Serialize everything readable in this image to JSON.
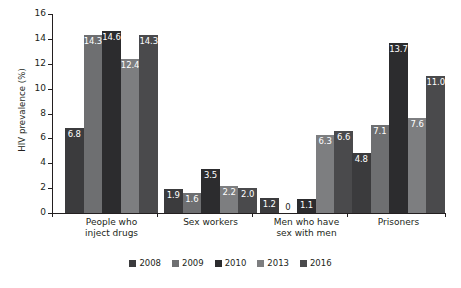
{
  "chart_data": {
    "type": "bar",
    "title": "",
    "xlabel": "",
    "ylabel": "HIV prevalence (%)",
    "ylim": [
      0,
      16
    ],
    "yticks": [
      0,
      2,
      4,
      6,
      8,
      10,
      12,
      14,
      16
    ],
    "grid": false,
    "legend_position": "bottom",
    "categories": [
      "People who inject drugs",
      "Sex workers",
      "Men who have sex with men",
      "Prisoners"
    ],
    "category_lines": [
      [
        "People who",
        "inject drugs"
      ],
      [
        "Sex workers"
      ],
      [
        "Men who have",
        "sex with men"
      ],
      [
        "Prisoners"
      ]
    ],
    "series": [
      {
        "name": "2008",
        "color": "#3b3b3d",
        "values": [
          6.8,
          1.9,
          1.2,
          4.8
        ],
        "labels": [
          "6.8",
          "1.9",
          "1.2",
          "4.8"
        ]
      },
      {
        "name": "2009",
        "color": "#6e6f71",
        "values": [
          14.3,
          1.6,
          0,
          7.1
        ],
        "labels": [
          "14.3",
          "1.6",
          "0",
          "7.1"
        ]
      },
      {
        "name": "2010",
        "color": "#2c2c2e",
        "values": [
          14.6,
          3.5,
          1.1,
          13.7
        ],
        "labels": [
          "14.6",
          "3.5",
          "1.1",
          "13.7"
        ]
      },
      {
        "name": "2013",
        "color": "#7d7e80",
        "values": [
          12.4,
          2.2,
          6.3,
          7.6
        ],
        "labels": [
          "12.4",
          "2.2",
          "6.3",
          "7.6"
        ]
      },
      {
        "name": "2016",
        "color": "#4a4a4c",
        "values": [
          14.3,
          2.0,
          6.6,
          11.0
        ],
        "labels": [
          "14.3",
          "2.0",
          "6.6",
          "11.0"
        ]
      }
    ]
  },
  "axis": {
    "tick_labels": [
      "16",
      "14",
      "12",
      "10",
      "8",
      "6",
      "4",
      "2",
      "0"
    ]
  }
}
